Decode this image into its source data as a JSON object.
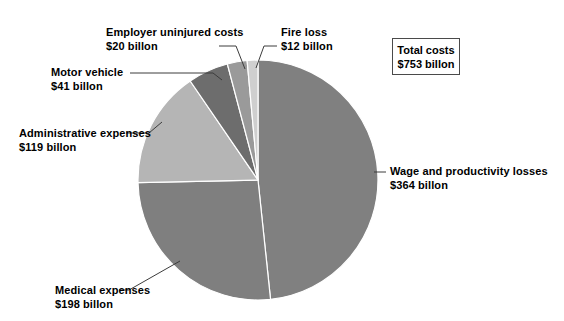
{
  "chart_data": {
    "type": "pie",
    "title": "",
    "subtitle": "",
    "xlabel": "",
    "ylabel": "",
    "units": "billion US dollars",
    "total": 753,
    "total_label": "Total costs",
    "total_value_label": "$753 billon",
    "legend_position": "callouts",
    "grid": false,
    "start_angle_deg": 0,
    "direction": "clockwise",
    "categories": [
      "Wage and productivity losses",
      "Medical expenses",
      "Administrative expenses",
      "Motor vehicle",
      "Employer uninjured costs",
      "Fire loss"
    ],
    "values": [
      364,
      198,
      119,
      41,
      20,
      12
    ],
    "value_labels": [
      "$364 billon",
      "$198 billon",
      "$119 billon",
      "$41 billon",
      "$20 billon",
      "$12 billon"
    ],
    "slices": [
      {
        "name": "Wage and productivity losses",
        "value": 364,
        "value_label": "$364 billon",
        "percent": 48.3,
        "color": "#808080",
        "start_deg": 0,
        "end_deg": 174.0
      },
      {
        "name": "Medical expenses",
        "value": 198,
        "value_label": "$198 billon",
        "percent": 26.3,
        "color": "#7f7f7f",
        "start_deg": 174.0,
        "end_deg": 268.7
      },
      {
        "name": "Administrative expenses",
        "value": 119,
        "value_label": "$119 billon",
        "percent": 15.8,
        "color": "#b5b5b5",
        "start_deg": 268.7,
        "end_deg": 325.6
      },
      {
        "name": "Motor vehicle",
        "value": 41,
        "value_label": "$41 billon",
        "percent": 5.4,
        "color": "#6d6d6d",
        "start_deg": 325.6,
        "end_deg": 345.2
      },
      {
        "name": "Employer uninjured costs",
        "value": 20,
        "value_label": "$20 billon",
        "percent": 2.7,
        "color": "#9a9a9a",
        "start_deg": 345.2,
        "end_deg": 354.8
      },
      {
        "name": "Fire loss",
        "value": 12,
        "value_label": "$12 billon",
        "percent": 1.6,
        "color": "#cfcfcf",
        "start_deg": 354.8,
        "end_deg": 360.0
      }
    ]
  },
  "callouts": {
    "employer": {
      "line1": "Employer uninjured costs",
      "line2": "$20 billon"
    },
    "fire": {
      "line1": "Fire loss",
      "line2": "$12 billon"
    },
    "motor": {
      "line1": "Motor vehicle",
      "line2": "$41 billon"
    },
    "admin": {
      "line1": "Administrative expenses",
      "line2": "$119 billon"
    },
    "medical": {
      "line1": "Medical expenses",
      "line2": "$198 billon"
    },
    "wage": {
      "line1": "Wage and productivity losses",
      "line2": "$364 billon"
    }
  },
  "total_box": {
    "line1": "Total costs",
    "line2": "$753 billon"
  },
  "colors": {
    "background": "#ffffff",
    "text": "#000000",
    "leader_line": "#3c3c3c",
    "box_border": "#4a4a4a",
    "slice_wage": "#808080",
    "slice_medical": "#7f7f7f",
    "slice_admin": "#b5b5b5",
    "slice_motor": "#6d6d6d",
    "slice_employer": "#9a9a9a",
    "slice_fire": "#cfcfcf"
  }
}
